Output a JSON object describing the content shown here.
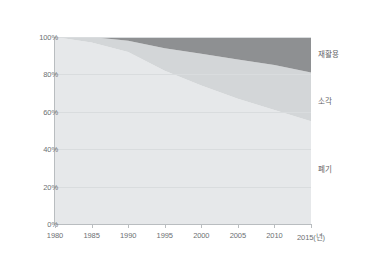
{
  "chart_data": {
    "type": "area",
    "stacked": true,
    "normalized": true,
    "title": "",
    "subtitle": "",
    "xlabel": "",
    "ylabel": "",
    "xlim": [
      1980,
      2015
    ],
    "ylim": [
      0,
      100
    ],
    "grid": true,
    "legend_position": "right-inline",
    "x": [
      1980,
      1985,
      1990,
      1995,
      2000,
      2005,
      2010,
      2015
    ],
    "x_tick_labels": [
      "1980",
      "1985",
      "1990",
      "1995",
      "2000",
      "2005",
      "2010",
      "2015(년)"
    ],
    "y_tick_labels": [
      "0%",
      "20%",
      "40%",
      "60%",
      "80%",
      "100%"
    ],
    "y_ticks": [
      0,
      20,
      40,
      60,
      80,
      100
    ],
    "series": [
      {
        "name": "폐기",
        "color": "#e6e8ea",
        "values": [
          100,
          97,
          92,
          82,
          74,
          67,
          61,
          55
        ]
      },
      {
        "name": "소각",
        "color": "#d3d6d8",
        "values": [
          0,
          3,
          6,
          12,
          17,
          21,
          24,
          26
        ]
      },
      {
        "name": "재활용",
        "color": "#8e9092",
        "values": [
          0,
          0,
          2,
          6,
          9,
          12,
          15,
          19
        ]
      }
    ],
    "annotations": [
      {
        "text": "재활용",
        "x": 2016,
        "y": 90
      },
      {
        "text": "소각",
        "x": 2016,
        "y": 68
      },
      {
        "text": "폐기",
        "x": 2016,
        "y": 30
      }
    ]
  },
  "axis": {
    "y_labels": [
      "100%",
      "80%",
      "60%",
      "40%",
      "20%",
      "0%"
    ],
    "x_labels": [
      "1980",
      "1985",
      "1990",
      "1995",
      "2000",
      "2005",
      "2010",
      "2015(년)"
    ]
  },
  "legend": {
    "recycle": "재활용",
    "incinerate": "소각",
    "landfill": "폐기"
  },
  "colors": {
    "recycle": "#8e9092",
    "incinerate": "#d3d6d8",
    "landfill": "#e6e8ea",
    "grid": "#d9dcde",
    "axis": "#b9bdc0",
    "text": "#6c7073",
    "background": "#ffffff"
  }
}
